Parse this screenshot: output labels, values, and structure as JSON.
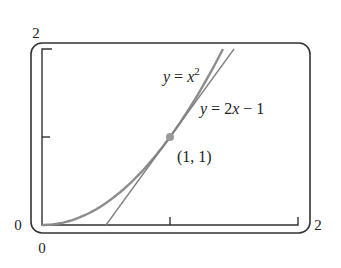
{
  "chart_data": {
    "type": "line",
    "title": "",
    "xlabel": "",
    "ylabel": "",
    "xlim": [
      0,
      2
    ],
    "ylim": [
      0,
      2
    ],
    "x_ticks": [
      0,
      1,
      2
    ],
    "y_ticks": [
      0,
      1,
      2
    ],
    "x_tick_labels": [
      "0",
      "2"
    ],
    "y_tick_labels": [
      "0",
      "2"
    ],
    "grid": false,
    "legend": null,
    "series": [
      {
        "name": "y = x^2",
        "label_text": "y = x",
        "label_sup": "2",
        "color": "#8c8c8c",
        "x": [
          0,
          0.2,
          0.4,
          0.6,
          0.8,
          1.0,
          1.2,
          1.414
        ],
        "y": [
          0,
          0.04,
          0.16,
          0.36,
          0.64,
          1.0,
          1.44,
          2.0
        ]
      },
      {
        "name": "y = 2x - 1",
        "label_text": "y = 2x − 1",
        "color": "#8c8c8c",
        "x": [
          0.5,
          1.5
        ],
        "y": [
          0,
          2
        ]
      }
    ],
    "annotations": [
      {
        "text": "(1, 1)",
        "x": 1,
        "y": 1,
        "marker": "point",
        "color": "#999999"
      }
    ]
  },
  "labels": {
    "y_max": "2",
    "y_min": "0",
    "x_min": "0",
    "x_max": "2",
    "parabola": "y = x",
    "parabola_sup": "2",
    "tangent": "y = 2x − 1",
    "point": "(1, 1)"
  }
}
